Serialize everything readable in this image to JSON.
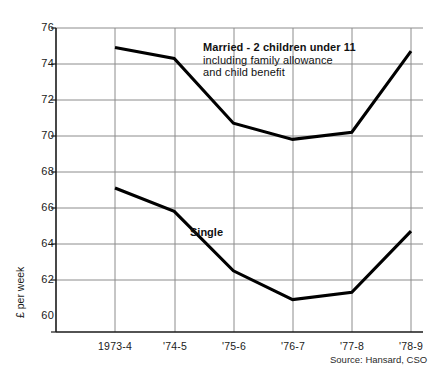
{
  "chart_data": {
    "type": "line",
    "title": "",
    "xlabel": "",
    "ylabel": "£ per week",
    "categories": [
      "1973-4",
      "'74-5",
      "'75-6",
      "'76-7",
      "'77-8",
      "'78-9"
    ],
    "ylim": [
      60,
      76
    ],
    "yticks": [
      60,
      62,
      64,
      66,
      68,
      70,
      72,
      74,
      76
    ],
    "ytick_labels": [
      "60",
      "62",
      "64",
      "66",
      "68",
      "70",
      "72",
      "74",
      "76"
    ],
    "grid": true,
    "legend_position": "inline-annotation",
    "series": [
      {
        "name": "Married - 2 children under 11",
        "label_line1": "Married - 2 children under 11",
        "label_line2": "including family allowance",
        "label_line3": "and child benefit",
        "values": [
          75.8,
          75.2,
          71.6,
          70.7,
          71.1,
          75.6
        ],
        "color": "#000000"
      },
      {
        "name": "Single",
        "label_line1": "Single",
        "values": [
          68.0,
          66.7,
          63.4,
          61.8,
          62.2,
          65.6
        ],
        "color": "#000000"
      }
    ],
    "annotations": [
      {
        "name": "source-note",
        "text": "Source: Hansard, CSO"
      }
    ]
  },
  "axis": {
    "y_title": "£ per week",
    "y_labels": [
      "76",
      "74",
      "72",
      "70",
      "68",
      "66",
      "64",
      "62",
      "60"
    ],
    "x_labels": [
      "1973-4",
      "'74-5",
      "'75-6",
      "'76-7",
      "'77-8",
      "'78-9"
    ]
  },
  "labels": {
    "married_line1": "Married - 2 children under 11",
    "married_line2": "including family allowance",
    "married_line3": "and child benefit",
    "single": "Single"
  },
  "footer": {
    "source": "Source: Hansard, CSO"
  },
  "artifacts": {
    "top_smudge": ""
  },
  "colors": {
    "line": "#000000",
    "grid": "#8c8c8c",
    "axis": "#1a1a1a",
    "background": "#ffffff"
  }
}
